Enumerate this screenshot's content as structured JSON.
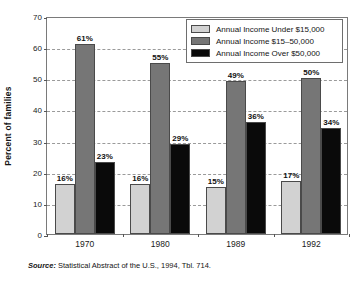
{
  "chart_data": {
    "type": "bar",
    "title": "",
    "xlabel": "",
    "ylabel": "Percent of families",
    "ylim": [
      0,
      70
    ],
    "ytick_step": 10,
    "yticks": [
      0,
      10,
      20,
      30,
      40,
      50,
      60,
      70
    ],
    "ytick_labels": [
      "0",
      "10",
      "20",
      "30",
      "40",
      "50",
      "60",
      "70"
    ],
    "grid": "horizontal-dashed",
    "legend_position": "top-right",
    "value_label_suffix": "%",
    "categories": [
      "1970",
      "1980",
      "1989",
      "1992"
    ],
    "series": [
      {
        "name": "Annual Income Under $15,000",
        "color": "#d2d2d2",
        "values": [
          16,
          16,
          15,
          17
        ],
        "labels": [
          "16%",
          "16%",
          "15%",
          "17%"
        ]
      },
      {
        "name": "Annual Income $15–50,000",
        "color": "#767676",
        "values": [
          61,
          55,
          49,
          50
        ],
        "labels": [
          "61%",
          "55%",
          "49%",
          "50%"
        ]
      },
      {
        "name": "Annual Income Over $50,000",
        "color": "#0a0a0a",
        "values": [
          23,
          29,
          36,
          34
        ],
        "labels": [
          "23%",
          "29%",
          "36%",
          "34%"
        ]
      }
    ]
  },
  "legend": {
    "items": [
      {
        "label": "Annual Income Under $15,000",
        "swatch": "light-gray-swatch"
      },
      {
        "label": "Annual Income $15–50,000",
        "swatch": "medium-gray-swatch"
      },
      {
        "label": "Annual Income Over $50,000",
        "swatch": "black-swatch"
      }
    ]
  },
  "source": {
    "prefix": "Source:",
    "text": " Statistical Abstract of the U.S., 1994, Tbl. 714."
  }
}
